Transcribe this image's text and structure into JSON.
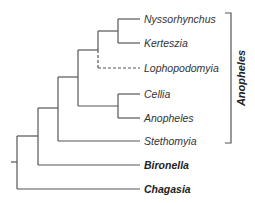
{
  "diagram": {
    "type": "phylogenetic-tree",
    "taxa": [
      {
        "name": "Nyssorhynchus",
        "y": 19,
        "bold": false
      },
      {
        "name": "Kerteszia",
        "y": 43,
        "bold": false
      },
      {
        "name": "Lophopodomyia",
        "y": 68,
        "bold": false,
        "dashed": true
      },
      {
        "name": "Cellia",
        "y": 94,
        "bold": false
      },
      {
        "name": "Anopheles",
        "y": 118,
        "bold": false
      },
      {
        "name": "Stethomyia",
        "y": 141,
        "bold": false
      },
      {
        "name": "Bironella",
        "y": 165,
        "bold": true
      },
      {
        "name": "Chagasia",
        "y": 189,
        "bold": true
      }
    ],
    "clade_bracket": {
      "label": "Anopheles",
      "spans": [
        "Nyssorhynchus",
        "Stethomyia"
      ]
    },
    "colors": {
      "branch": "#555555",
      "text": "#333333"
    }
  }
}
